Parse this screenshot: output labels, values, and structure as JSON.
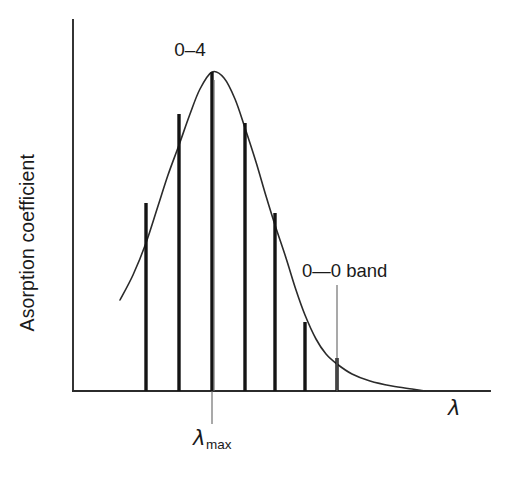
{
  "figure": {
    "y_axis_label": "Asorption coefficient",
    "x_axis_label": "λ",
    "lambda_max_symbol": "λ",
    "lambda_max_subscript": "max",
    "peak_annotation": "0–4",
    "band_annotation": "0—0 band"
  },
  "chart_data": {
    "type": "line",
    "title": "",
    "subtitle": "",
    "xlabel": "λ",
    "ylabel": "Asorption coefficient",
    "grid": false,
    "legend": null,
    "axes": {
      "x_axis_pixel_y": 391,
      "y_axis_pixel_x": 73,
      "y_axis_top_pixel_y": 20,
      "x_axis_right_pixel_x": 490,
      "x_tick_labels": [
        "λmax"
      ],
      "y_tick_labels": []
    },
    "series": [
      {
        "name": "absorption envelope",
        "type": "line",
        "points": [
          [
            120,
            300
          ],
          [
            133,
            275
          ],
          [
            146,
            243
          ],
          [
            158,
            206
          ],
          [
            168,
            175
          ],
          [
            179,
            145
          ],
          [
            190,
            114
          ],
          [
            200,
            89
          ],
          [
            212,
            72
          ],
          [
            224,
            78
          ],
          [
            235,
            99
          ],
          [
            245,
            128
          ],
          [
            256,
            162
          ],
          [
            266,
            196
          ],
          [
            275,
            225
          ],
          [
            286,
            258
          ],
          [
            296,
            290
          ],
          [
            305,
            315
          ],
          [
            316,
            339
          ],
          [
            326,
            354
          ],
          [
            337,
            364
          ],
          [
            352,
            374
          ],
          [
            370,
            381
          ],
          [
            392,
            386
          ],
          [
            412,
            389
          ],
          [
            425,
            391
          ]
        ]
      },
      {
        "name": "vibronic transition lines",
        "type": "bar",
        "categories": [
          "0–7",
          "0–6",
          "0–5",
          "0–4",
          "0–3",
          "0–2",
          "0–1",
          "0–0"
        ],
        "bars": [
          {
            "label": "",
            "x_pixel": 146,
            "top_pixel_y": 203,
            "baseline_pixel_y": 391,
            "height_px": 188,
            "relative_height": 0.589
          },
          {
            "label": "",
            "x_pixel": 179,
            "top_pixel_y": 114,
            "baseline_pixel_y": 391,
            "height_px": 277,
            "relative_height": 0.868
          },
          {
            "label": "0–4",
            "x_pixel": 212,
            "top_pixel_y": 72,
            "baseline_pixel_y": 391,
            "height_px": 319,
            "relative_height": 1.0
          },
          {
            "label": "",
            "x_pixel": 245,
            "top_pixel_y": 123,
            "baseline_pixel_y": 391,
            "height_px": 268,
            "relative_height": 0.84
          },
          {
            "label": "",
            "x_pixel": 275,
            "top_pixel_y": 213,
            "baseline_pixel_y": 391,
            "height_px": 178,
            "relative_height": 0.558
          },
          {
            "label": "",
            "x_pixel": 305,
            "top_pixel_y": 322,
            "baseline_pixel_y": 391,
            "height_px": 69,
            "relative_height": 0.216
          },
          {
            "label": "0–0 band",
            "x_pixel": 337,
            "top_pixel_y": 358,
            "baseline_pixel_y": 391,
            "height_px": 33,
            "relative_height": 0.103
          }
        ]
      }
    ],
    "annotations": [
      {
        "text": "0–4",
        "kind": "peak-label",
        "target_x_pixel": 212,
        "text_x_pixel": 190,
        "text_y_pixel": 40
      },
      {
        "text": "0—0 band",
        "kind": "leader-label",
        "target_x_pixel": 337,
        "leader_from_y_pixel": 285,
        "leader_to_y_pixel": 391,
        "text_x_pixel": 302,
        "text_y_pixel": 262
      },
      {
        "text": "λmax",
        "kind": "axis-tick-label",
        "target_x_pixel": 212,
        "tick_from_y_pixel": 391,
        "tick_to_y_pixel": 424
      }
    ]
  },
  "colors": {
    "background": "#ffffff",
    "axis": "#2b2b2b",
    "curve": "#2b2b2b",
    "bar": "#141414",
    "leader": "#6a6a6a",
    "text": "#1a1a1a"
  }
}
